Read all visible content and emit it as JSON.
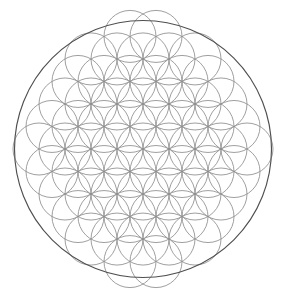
{
  "document": {
    "title": "Flower of Life",
    "type": "sacred-geometry-diagram",
    "alt_text": "Flower of Life pattern: overlapping circles on a hexagonal lattice enclosed by a single outer circle"
  },
  "canvas": {
    "width": 286,
    "height": 297,
    "background_color": "#ffffff"
  },
  "figure": {
    "center_x": 143,
    "center_y": 149,
    "outer_circle": {
      "radius": 128.5,
      "stroke_color": "#4f4f4f",
      "stroke_width": 1.15,
      "fill": "none"
    },
    "grid": {
      "lattice": "hexagonal",
      "unit_radius": 26,
      "row_spacing": 22.516660498395403,
      "column_spacing": 26,
      "stroke_color": "#8e8e8e",
      "stroke_width": 0.85,
      "fill": "none",
      "clip_radius": 117,
      "rows": [
        {
          "row": -5,
          "count": 2,
          "x_offset": 13
        },
        {
          "row": -4,
          "count": 5,
          "x_offset": 0
        },
        {
          "row": -3,
          "count": 6,
          "x_offset": 13
        },
        {
          "row": -2,
          "count": 7,
          "x_offset": 0
        },
        {
          "row": -1,
          "count": 8,
          "x_offset": 13
        },
        {
          "row": 0,
          "count": 9,
          "x_offset": 0
        },
        {
          "row": 1,
          "count": 8,
          "x_offset": 13
        },
        {
          "row": 2,
          "count": 7,
          "x_offset": 0
        },
        {
          "row": 3,
          "count": 6,
          "x_offset": 13
        },
        {
          "row": 4,
          "count": 5,
          "x_offset": 0
        },
        {
          "row": 5,
          "count": 2,
          "x_offset": 13
        }
      ]
    }
  },
  "chart_data": {
    "type": "scatter",
    "title": "Flower of Life",
    "xlabel": "",
    "ylabel": "",
    "xlim": [
      0,
      286
    ],
    "ylim": [
      0,
      297
    ],
    "grid": false,
    "legend": "none",
    "annotations": [],
    "series": [
      {
        "name": "outer-boundary-circle",
        "shape": "circle",
        "stroke": "#4f4f4f",
        "points": [
          {
            "cx": 143,
            "cy": 149,
            "r": 128.5
          }
        ]
      },
      {
        "name": "flower-of-life-circles",
        "shape": "circle",
        "stroke": "#8e8e8e",
        "radius": 26,
        "points": [
          {
            "cx": 143,
            "cy": 149
          },
          {
            "cx": 117,
            "cy": 149
          },
          {
            "cx": 169,
            "cy": 149
          },
          {
            "cx": 91,
            "cy": 149
          },
          {
            "cx": 195,
            "cy": 149
          },
          {
            "cx": 65,
            "cy": 149
          },
          {
            "cx": 221,
            "cy": 149
          },
          {
            "cx": 39,
            "cy": 149
          },
          {
            "cx": 247,
            "cy": 149
          },
          {
            "cx": 130,
            "cy": 126.48
          },
          {
            "cx": 156,
            "cy": 126.48
          },
          {
            "cx": 104,
            "cy": 126.48
          },
          {
            "cx": 182,
            "cy": 126.48
          },
          {
            "cx": 78,
            "cy": 126.48
          },
          {
            "cx": 208,
            "cy": 126.48
          },
          {
            "cx": 52,
            "cy": 126.48
          },
          {
            "cx": 234,
            "cy": 126.48
          },
          {
            "cx": 130,
            "cy": 171.52
          },
          {
            "cx": 156,
            "cy": 171.52
          },
          {
            "cx": 104,
            "cy": 171.52
          },
          {
            "cx": 182,
            "cy": 171.52
          },
          {
            "cx": 78,
            "cy": 171.52
          },
          {
            "cx": 208,
            "cy": 171.52
          },
          {
            "cx": 52,
            "cy": 171.52
          },
          {
            "cx": 234,
            "cy": 171.52
          },
          {
            "cx": 143,
            "cy": 103.97
          },
          {
            "cx": 117,
            "cy": 103.97
          },
          {
            "cx": 169,
            "cy": 103.97
          },
          {
            "cx": 91,
            "cy": 103.97
          },
          {
            "cx": 195,
            "cy": 103.97
          },
          {
            "cx": 65,
            "cy": 103.97
          },
          {
            "cx": 221,
            "cy": 103.97
          },
          {
            "cx": 143,
            "cy": 194.03
          },
          {
            "cx": 117,
            "cy": 194.03
          },
          {
            "cx": 169,
            "cy": 194.03
          },
          {
            "cx": 91,
            "cy": 194.03
          },
          {
            "cx": 195,
            "cy": 194.03
          },
          {
            "cx": 65,
            "cy": 194.03
          },
          {
            "cx": 221,
            "cy": 194.03
          },
          {
            "cx": 130,
            "cy": 81.45
          },
          {
            "cx": 156,
            "cy": 81.45
          },
          {
            "cx": 104,
            "cy": 81.45
          },
          {
            "cx": 182,
            "cy": 81.45
          },
          {
            "cx": 78,
            "cy": 81.45
          },
          {
            "cx": 208,
            "cy": 81.45
          },
          {
            "cx": 130,
            "cy": 216.55
          },
          {
            "cx": 156,
            "cy": 216.55
          },
          {
            "cx": 104,
            "cy": 216.55
          },
          {
            "cx": 182,
            "cy": 216.55
          },
          {
            "cx": 78,
            "cy": 216.55
          },
          {
            "cx": 208,
            "cy": 216.55
          },
          {
            "cx": 143,
            "cy": 58.93
          },
          {
            "cx": 117,
            "cy": 58.93
          },
          {
            "cx": 169,
            "cy": 58.93
          },
          {
            "cx": 91,
            "cy": 58.93
          },
          {
            "cx": 195,
            "cy": 58.93
          },
          {
            "cx": 143,
            "cy": 239.07
          },
          {
            "cx": 117,
            "cy": 239.07
          },
          {
            "cx": 169,
            "cy": 239.07
          },
          {
            "cx": 91,
            "cy": 239.07
          },
          {
            "cx": 195,
            "cy": 239.07
          },
          {
            "cx": 130,
            "cy": 36.42
          },
          {
            "cx": 156,
            "cy": 36.42
          },
          {
            "cx": 130,
            "cy": 261.58
          },
          {
            "cx": 156,
            "cy": 261.58
          }
        ]
      }
    ]
  }
}
